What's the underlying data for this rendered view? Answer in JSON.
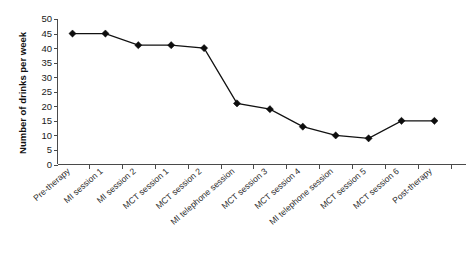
{
  "chart_data": {
    "type": "line",
    "title": "",
    "xlabel": "",
    "ylabel": "Number of drinks per week",
    "ylim": [
      0,
      50
    ],
    "yticks": [
      0,
      5,
      10,
      15,
      20,
      25,
      30,
      35,
      40,
      45,
      50
    ],
    "grid": false,
    "legend": "none",
    "marker": "diamond",
    "line_color": "#111111",
    "marker_color": "#0d0d0d",
    "categories": [
      "Pre-therapy",
      "MI session 1",
      "MI session 2",
      "MCT session 1",
      "MCT session 2",
      "MI telephone session",
      "MCT session 3",
      "MCT session 4",
      "MI telephone session",
      "MCT session 5",
      "MCT session 6",
      "Post-therapy"
    ],
    "values": [
      45,
      45,
      41,
      41,
      40,
      21,
      19,
      13,
      10,
      9,
      15,
      15
    ]
  }
}
